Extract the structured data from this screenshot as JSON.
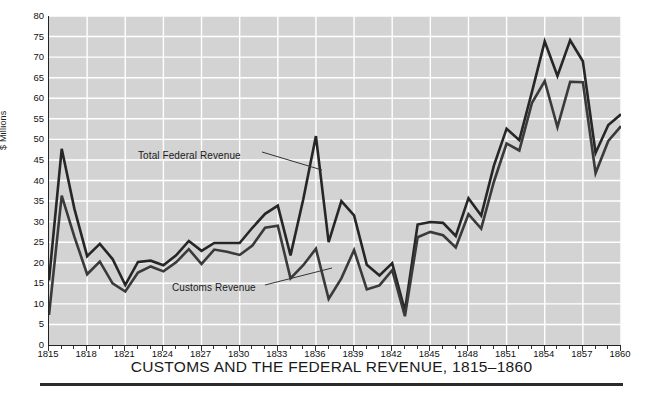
{
  "chart_data": {
    "type": "line",
    "title": "CUSTOMS AND THE FEDERAL REVENUE, 1815–1860",
    "xlabel": "",
    "ylabel": "$ Millions",
    "ylim": [
      0,
      80
    ],
    "xlim": [
      1815,
      1860
    ],
    "ytick_step": 5,
    "xtick_step": 3,
    "grid": true,
    "legend": "inline-annotations",
    "yticks": [
      0,
      5,
      10,
      15,
      20,
      25,
      30,
      35,
      40,
      45,
      50,
      55,
      60,
      65,
      70,
      75,
      80
    ],
    "xticks": [
      1815,
      1818,
      1821,
      1824,
      1827,
      1830,
      1833,
      1836,
      1839,
      1842,
      1845,
      1848,
      1851,
      1854,
      1857,
      1860
    ],
    "x": [
      1815,
      1816,
      1817,
      1818,
      1819,
      1820,
      1821,
      1822,
      1823,
      1824,
      1825,
      1826,
      1827,
      1828,
      1829,
      1830,
      1831,
      1832,
      1833,
      1834,
      1835,
      1836,
      1837,
      1838,
      1839,
      1840,
      1841,
      1842,
      1843,
      1844,
      1845,
      1846,
      1847,
      1848,
      1849,
      1850,
      1851,
      1852,
      1853,
      1854,
      1855,
      1856,
      1857,
      1858,
      1859,
      1860
    ],
    "series": [
      {
        "name": "Total Federal Revenue",
        "color": "#262626",
        "values": [
          15.7,
          47.7,
          33.1,
          21.6,
          24.6,
          20.9,
          14.6,
          20.2,
          20.5,
          19.4,
          21.8,
          25.3,
          22.9,
          24.8,
          24.8,
          24.8,
          28.5,
          31.9,
          33.9,
          21.8,
          35.4,
          50.8,
          25.0,
          35.0,
          31.5,
          19.5,
          16.9,
          19.9,
          8.3,
          29.3,
          29.9,
          29.7,
          26.5,
          35.7,
          31.5,
          43.6,
          52.6,
          49.8,
          61.6,
          73.8,
          65.4,
          74.1,
          69.0,
          46.7,
          53.5,
          56.1
        ]
      },
      {
        "name": "Customs Revenue",
        "color": "#3a3a3a",
        "values": [
          7.3,
          36.3,
          26.3,
          17.2,
          20.3,
          15.0,
          13.0,
          17.6,
          19.1,
          17.9,
          20.1,
          23.3,
          19.7,
          23.2,
          22.7,
          21.9,
          24.2,
          28.5,
          29.0,
          16.2,
          19.4,
          23.4,
          11.2,
          16.2,
          23.1,
          13.5,
          14.5,
          18.2,
          7.0,
          26.2,
          27.5,
          26.7,
          23.7,
          31.8,
          28.3,
          39.7,
          49.0,
          47.3,
          58.9,
          64.2,
          53.0,
          64.0,
          63.9,
          41.8,
          49.6,
          53.2
        ]
      }
    ],
    "annotations": [
      {
        "id": "total-federal-revenue",
        "text": "Total Federal Revenue",
        "label_x": 138,
        "label_y": 150,
        "leader": [
          [
            262,
            152
          ],
          [
            322,
            170
          ]
        ]
      },
      {
        "id": "customs-revenue",
        "text": "Customs Revenue",
        "label_x": 172,
        "label_y": 282,
        "leader": [
          [
            265,
            285
          ],
          [
            332,
            268
          ]
        ]
      }
    ]
  },
  "style": {
    "plot_background": "#d3d3d3",
    "grid_color": "#ffffff",
    "axis_color": "#222222",
    "text_color": "#1a1a1a",
    "page_background": "#ffffff"
  }
}
